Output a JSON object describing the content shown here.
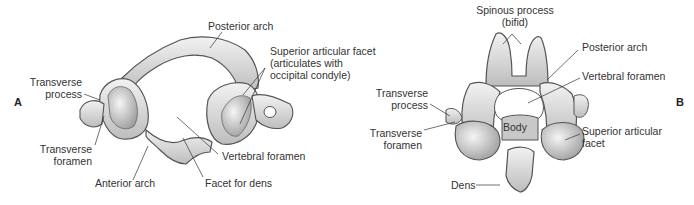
{
  "figure": {
    "panels": [
      {
        "id": "A",
        "subject": "Atlas (C1) vertebra, superior view",
        "labels": {
          "posterior_arch": "Posterior arch",
          "superior_facet_1": "Superior articular facet",
          "superior_facet_2": "(articulates with",
          "superior_facet_3": "occipital condyle)",
          "transverse_process_1": "Transverse",
          "transverse_process_2": "process",
          "transverse_foramen_1": "Transverse",
          "transverse_foramen_2": "foramen",
          "anterior_arch": "Anterior arch",
          "vertebral_foramen": "Vertebral foramen",
          "facet_for_dens": "Facet for dens"
        }
      },
      {
        "id": "B",
        "subject": "Axis (C2) vertebra, posterosuperior view",
        "labels": {
          "spinous_process_1": "Spinous process",
          "spinous_process_2": "(bifid)",
          "posterior_arch": "Posterior arch",
          "vertebral_foramen": "Vertebral foramen",
          "transverse_process_1": "Transverse",
          "transverse_process_2": "process",
          "transverse_foramen_1": "Transverse",
          "transverse_foramen_2": "foramen",
          "body": "Body",
          "superior_facet_1": "Superior articular",
          "superior_facet_2": "facet",
          "dens": "Dens"
        }
      }
    ],
    "colors": {
      "bone_fill": "#e4e4e4",
      "bone_shade": "#a8a8a8",
      "outline": "#555555",
      "leader": "#333333"
    }
  }
}
